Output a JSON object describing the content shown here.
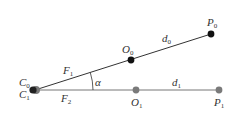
{
  "diagram": {
    "colors": {
      "top_line": "#333333",
      "bottom_line": "#777777",
      "top_point": "#111111",
      "bottom_point": "#7a7a7a",
      "origin_point": "#222222",
      "text": "#333333"
    },
    "labels": {
      "C0": {
        "base": "C",
        "sub": "0"
      },
      "C1": {
        "base": "C",
        "sub": "1"
      },
      "F1": {
        "base": "F",
        "sub": "1"
      },
      "F2": {
        "base": "F",
        "sub": "2"
      },
      "alpha": {
        "base": "α"
      },
      "d0": {
        "base": "d",
        "sub": "0"
      },
      "d1": {
        "base": "d",
        "sub": "1"
      },
      "O0": {
        "base": "O",
        "sub": "0"
      },
      "O1": {
        "base": "O",
        "sub": "1"
      },
      "P0": {
        "base": "P",
        "sub": "0"
      },
      "P1": {
        "base": "P",
        "sub": "1"
      }
    },
    "points": {
      "C": {
        "x": 35,
        "y": 90
      },
      "O0": {
        "x": 131,
        "y": 60
      },
      "P0": {
        "x": 211,
        "y": 34
      },
      "O1": {
        "x": 136,
        "y": 90
      },
      "P1": {
        "x": 219,
        "y": 90
      }
    }
  }
}
